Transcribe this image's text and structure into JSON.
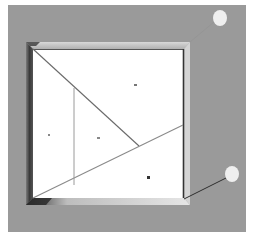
{
  "diagram": {
    "background": {
      "x": 8,
      "y": 5,
      "width": 238,
      "height": 227,
      "color": "#9a9a9a"
    },
    "frame": {
      "outer": {
        "x": 26,
        "y": 42,
        "width": 164,
        "height": 163,
        "color": "#c9c9c9"
      },
      "inner": {
        "x": 33,
        "y": 49,
        "width": 151,
        "height": 149,
        "color": "#ffffff"
      },
      "shadow_color": "#3a3a3a",
      "edge_color": "#444444"
    },
    "lines": [
      {
        "id": "diag-top-left",
        "x1": 33,
        "y1": 49,
        "x2": 139,
        "y2": 146,
        "color": "#6a6a6a"
      },
      {
        "id": "diag-long",
        "x1": 33,
        "y1": 198,
        "x2": 183,
        "y2": 125,
        "color": "#8a8a8a"
      },
      {
        "id": "vertical",
        "x1": 74,
        "y1": 88,
        "x2": 74,
        "y2": 185,
        "color": "#9a9a9a"
      }
    ],
    "region_marks": [
      {
        "x": 135,
        "y": 85
      },
      {
        "x": 49,
        "y": 135
      },
      {
        "x": 98,
        "y": 138
      },
      {
        "x": 148,
        "y": 177
      }
    ],
    "markers": [
      {
        "id": "marker-top-right",
        "cx": 220,
        "cy": 18,
        "rx": 7,
        "ry": 8,
        "color": "#efefef"
      },
      {
        "id": "marker-bottom-right",
        "cx": 232,
        "cy": 174,
        "rx": 7,
        "ry": 8,
        "color": "#efefef"
      }
    ],
    "connector": {
      "x1": 226,
      "y1": 178,
      "x2": 184,
      "y2": 199,
      "color": "#2e2e2e"
    }
  }
}
